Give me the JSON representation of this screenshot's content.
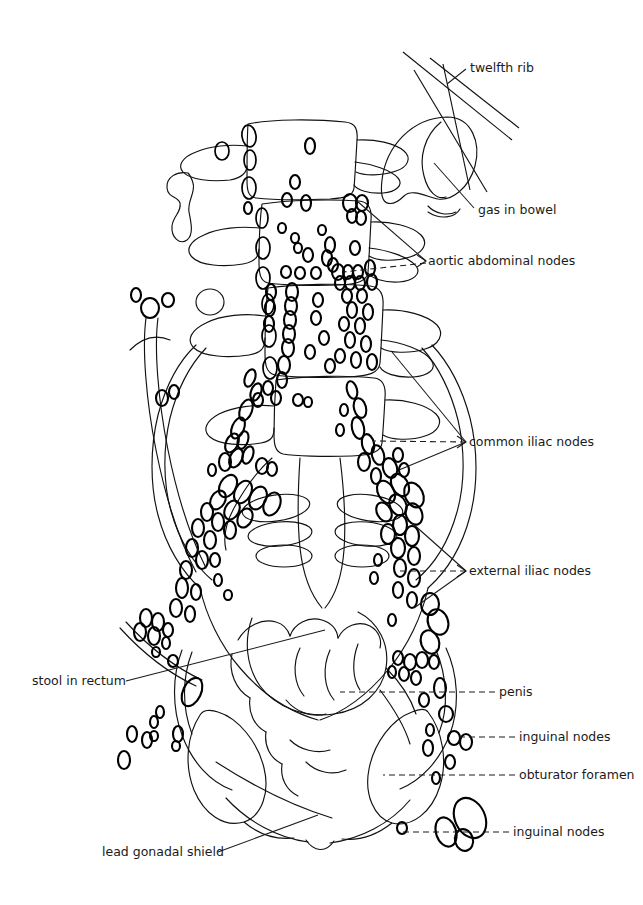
{
  "figure": {
    "kind": "hand-drawn line tracing of a pelvic / abdominal lymphangiogram radiograph",
    "background_color": "#ffffff",
    "ink_color": "#111111",
    "width": 643,
    "height": 905
  },
  "labels": [
    {
      "id": "twelfth-rib",
      "text": "twelfth rib",
      "text_x": 470,
      "text_y": 72,
      "anchor": "start",
      "leader": "M466,69 L447,84",
      "leader_style": "solid",
      "arrow": false
    },
    {
      "id": "gas-in-bowel",
      "text": "gas in bowel",
      "text_x": 478,
      "text_y": 214,
      "anchor": "start",
      "leader": "M474,208 L434,163",
      "leader_style": "solid",
      "arrow": false
    },
    {
      "id": "aortic-abdominal-nodes",
      "text": "aortic abdominal nodes",
      "text_x": 428,
      "text_y": 265,
      "anchor": "start",
      "leader": "M426,261 L357,201 M426,263 L343,272",
      "leader_style": "mixed",
      "arrow": true
    },
    {
      "id": "common-iliac-nodes",
      "text": "common iliac nodes",
      "text_x": 469,
      "text_y": 446,
      "anchor": "start",
      "leader": "M466,442 L392,352 M466,442 L399,470 M466,442 L373,441",
      "leader_style": "mixed",
      "arrow": true
    },
    {
      "id": "external-iliac-nodes",
      "text": "external iliac nodes",
      "text_x": 469,
      "text_y": 575,
      "anchor": "start",
      "leader": "M466,571 L412,523 M466,571 L414,608 M466,571 L398,571",
      "leader_style": "mixed",
      "arrow": true
    },
    {
      "id": "penis",
      "text": "penis",
      "text_x": 499,
      "text_y": 696,
      "anchor": "start",
      "leader": "M495,692 L340,692",
      "leader_style": "dashed",
      "arrow": false
    },
    {
      "id": "inguinal-nodes-upper",
      "text": "inguinal nodes",
      "text_x": 519,
      "text_y": 741,
      "anchor": "start",
      "leader": "M515,737 L458,737",
      "leader_style": "dashed",
      "arrow": false
    },
    {
      "id": "obturator-foramen",
      "text": "obturator foramen",
      "text_x": 519,
      "text_y": 779,
      "anchor": "start",
      "leader": "M515,775 L383,775",
      "leader_style": "dashed",
      "arrow": false
    },
    {
      "id": "inguinal-nodes-lower",
      "text": "inguinal nodes",
      "text_x": 513,
      "text_y": 836,
      "anchor": "start",
      "leader": "M509,832 L398,832",
      "leader_style": "dashed",
      "arrow": false
    },
    {
      "id": "stool-in-rectum",
      "text": "stool in rectum",
      "text_x": 32,
      "text_y": 685,
      "anchor": "start",
      "leader": "M126,681 L325,630",
      "leader_style": "solid",
      "arrow": false
    },
    {
      "id": "lead-gonadal-shield",
      "text": "lead gonadal shield",
      "text_x": 102,
      "text_y": 856,
      "anchor": "start",
      "leader": "M218,852 L318,815",
      "leader_style": "solid",
      "arrow": false
    }
  ]
}
